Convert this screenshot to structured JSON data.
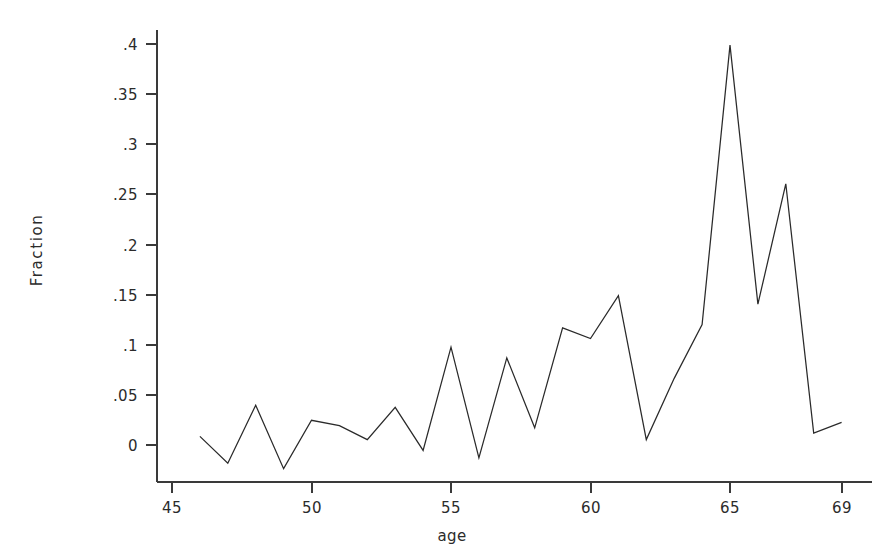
{
  "chart_data": {
    "type": "line",
    "title": "",
    "subtitle": "",
    "xlabel": "age",
    "ylabel": "Fraction",
    "x": [
      46,
      47,
      48,
      49,
      50,
      51,
      52,
      53,
      54,
      55,
      56,
      57,
      58,
      59,
      60,
      61,
      62,
      63,
      64,
      65,
      66,
      67,
      68,
      69
    ],
    "values": [
      0.008,
      -0.017,
      0.037,
      -0.022,
      0.023,
      0.018,
      0.005,
      0.035,
      -0.005,
      0.091,
      -0.012,
      0.081,
      0.016,
      0.109,
      0.099,
      0.139,
      0.005,
      0.062,
      0.112,
      0.372,
      0.131,
      0.243,
      0.011,
      0.021
    ],
    "series": [
      {
        "name": "Fraction",
        "values": [
          0.008,
          -0.017,
          0.037,
          -0.022,
          0.023,
          0.018,
          0.005,
          0.035,
          -0.005,
          0.091,
          -0.012,
          0.081,
          0.016,
          0.109,
          0.099,
          0.139,
          0.005,
          0.062,
          0.112,
          0.372,
          0.131,
          0.243,
          0.011,
          0.021
        ],
        "color": "#2a2a2a"
      }
    ],
    "xlim": [
      45,
      69
    ],
    "ylim": [
      -0.0275,
      0.4
    ],
    "grid": false,
    "legend": false,
    "legend_position": "none",
    "x_ticks": [
      45,
      50,
      55,
      60,
      65,
      69
    ],
    "x_tick_labels": [
      "45",
      "50",
      "55",
      "60",
      "65",
      "69"
    ],
    "y_ticks": [
      0,
      0.05,
      0.1,
      0.15,
      0.2,
      0.25,
      0.3,
      0.35,
      0.4
    ],
    "y_tick_labels": [
      "0",
      ".05",
      ".1",
      ".15",
      ".2",
      ".25",
      ".3",
      ".35",
      ".4"
    ],
    "line_color": "#2a2a2a",
    "axis_color": "#3a3a3a",
    "background_color": "#ffffff"
  },
  "geometry": {
    "x_axis_y": 482,
    "y_axis_x": 157,
    "y_axis_top": 30,
    "x_axis_right": 872,
    "x_origin_px": 172,
    "px_per_year": 27.9,
    "y_zero_px": 445,
    "px_per_unit": 1075
  }
}
